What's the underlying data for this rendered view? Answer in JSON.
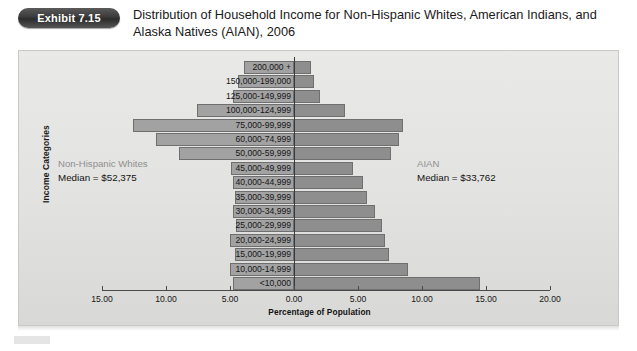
{
  "header": {
    "badge_label": "Exhibit 7.15",
    "title": "Distribution of Household Income for Non-Hispanic Whites, American Indians, and Alaska Natives (AIAN), 2006"
  },
  "annotations": {
    "left": {
      "group": "Non-Hispanic Whites",
      "median": "Median = $52,375"
    },
    "right": {
      "group": "AIAN",
      "median": "Median = $33,762"
    }
  },
  "axis": {
    "ylabel": "Income Categories",
    "xlabel": "Percentage of Population",
    "xticks": [
      "15.00",
      "10.00",
      "5.00",
      "0.00",
      "5.00",
      "10.00",
      "15.00",
      "20.00"
    ]
  },
  "colors": {
    "bar_left": "#a2a2a2",
    "bar_right": "#8e8e8e",
    "bar_border": "#6f6f6f",
    "panel_bg": "#e5e5e3",
    "badge": "#3b3b3b",
    "annot_gray": "#8f8f8f"
  },
  "chart_data": {
    "type": "bar",
    "subtype": "population-pyramid",
    "title": "Distribution of Household Income for Non-Hispanic Whites, American Indians, and Alaska Natives (AIAN), 2006",
    "xlabel": "Percentage of Population",
    "ylabel": "Income Categories",
    "xlim": [
      -15,
      20
    ],
    "xticks": [
      -15,
      -10,
      -5,
      0,
      5,
      10,
      15,
      20
    ],
    "xtick_labels": [
      "15.00",
      "10.00",
      "5.00",
      "0.00",
      "5.00",
      "10.00",
      "15.00",
      "20.00"
    ],
    "grid": false,
    "legend": "inline-annotations",
    "categories": [
      "200,000 +",
      "150,000-199,000",
      "125,000-149,999",
      "100,000-124,999",
      "75,000-99,999",
      "60,000-74,999",
      "50,000-59,999",
      "45,000-49,999",
      "40,000-44,999",
      "35,000-39,999",
      "30,000-34,999",
      "25,000-29,999",
      "20,000-24,999",
      "15,000-19,999",
      "10,000-14,999",
      "<10,000"
    ],
    "series": [
      {
        "name": "Non-Hispanic Whites",
        "side": "left",
        "median": 52375,
        "values": [
          3.9,
          4.4,
          4.8,
          7.6,
          12.6,
          10.8,
          9.0,
          4.9,
          4.8,
          4.6,
          4.8,
          4.5,
          5.0,
          4.6,
          5.0,
          4.8
        ]
      },
      {
        "name": "AIAN",
        "side": "right",
        "median": 33762,
        "values": [
          1.3,
          1.6,
          2.0,
          4.0,
          8.5,
          8.2,
          7.6,
          4.6,
          5.4,
          5.7,
          6.3,
          6.9,
          7.1,
          7.4,
          8.9,
          14.5
        ]
      }
    ]
  }
}
